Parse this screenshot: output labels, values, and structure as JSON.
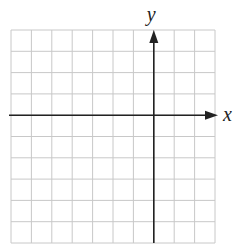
{
  "diagram": {
    "type": "coordinate-grid",
    "grid": {
      "columns": 10,
      "rows": 10,
      "left": 11,
      "top": 30,
      "right": 215,
      "bottom": 243,
      "line_color": "#c8c8c8"
    },
    "axes": {
      "color": "#222222",
      "x_axis": {
        "label": "x",
        "row_index": 4
      },
      "y_axis": {
        "label": "y",
        "column_index": 7
      }
    }
  }
}
